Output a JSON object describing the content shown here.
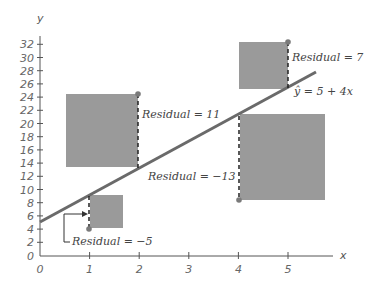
{
  "chart_data": {
    "type": "scatter",
    "title": "",
    "xlabel": "x",
    "ylabel": "y",
    "xlim": [
      0,
      5.8
    ],
    "ylim": [
      0,
      33
    ],
    "x_ticks": [
      0,
      1,
      2,
      3,
      4,
      5
    ],
    "y_ticks": [
      0,
      2,
      4,
      6,
      8,
      10,
      12,
      14,
      16,
      18,
      20,
      22,
      24,
      26,
      28,
      30,
      32
    ],
    "grid": false,
    "regression_line": {
      "equation": "ŷ = 5 + 4x",
      "intercept": 5,
      "slope": 4,
      "x_range": [
        0,
        5.55
      ]
    },
    "points": [
      {
        "x": 1,
        "y": 4,
        "predicted": 9,
        "residual": -5,
        "label": "Residual = −5"
      },
      {
        "x": 2,
        "y": 24,
        "predicted": 13,
        "residual": 11,
        "label": "Residual = 11"
      },
      {
        "x": 4,
        "y": 8,
        "predicted": 21,
        "residual": -13,
        "label": "Residual = −13"
      },
      {
        "x": 5,
        "y": 32,
        "predicted": 25,
        "residual": 7,
        "label": "Residual = 7"
      }
    ],
    "annotations": [
      "Residual = 7",
      "ŷ = 5 + 4x",
      "Residual = 11",
      "Residual = −13",
      "Residual = −5"
    ],
    "squared_residual_squares": true,
    "colors": {
      "line": "#6a6a6a",
      "square": "#9a9a9a",
      "point": "#7a7a7a",
      "axis": "#555555"
    }
  },
  "labels": {
    "y_axis": "y",
    "x_axis": "x",
    "equation": "ŷ = 5 + 4x",
    "res1": "Residual = −5",
    "res2": "Residual = 11",
    "res4": "Residual = −13",
    "res5": "Residual = 7"
  },
  "ticks": {
    "x": [
      "0",
      "1",
      "2",
      "3",
      "4",
      "5"
    ],
    "y": [
      "0",
      "2",
      "4",
      "6",
      "8",
      "10",
      "12",
      "14",
      "16",
      "18",
      "20",
      "22",
      "24",
      "26",
      "28",
      "30",
      "32"
    ]
  }
}
